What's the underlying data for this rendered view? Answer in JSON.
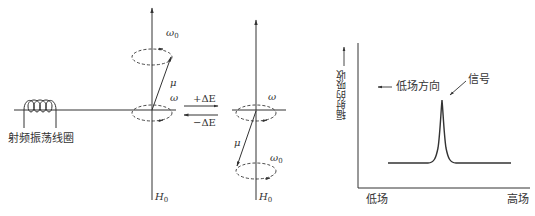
{
  "left_diagram": {
    "coil_label": "射频振荡线圈",
    "state1": {
      "top_label": "ω",
      "top_sub": "0",
      "mu": "μ",
      "omega": "ω",
      "field_label": "H",
      "field_sub": "0"
    },
    "transition": {
      "forward": "+ΔE",
      "backward": "−ΔE"
    },
    "state2": {
      "omega": "ω",
      "mu": "μ",
      "bottom_label": "ω",
      "bottom_sub": "0",
      "field_label": "H",
      "field_sub": "0"
    }
  },
  "right_chart": {
    "y_axis_label": "辐射的吸收",
    "direction_label": "低场方向",
    "signal_label": "信号",
    "x_left": "低场",
    "x_right": "高场"
  },
  "colors": {
    "line": "#333333",
    "background": "#ffffff"
  }
}
